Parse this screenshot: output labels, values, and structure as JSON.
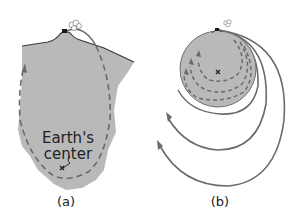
{
  "panels": [
    {
      "id": "a",
      "caption": "(a)",
      "center_label_line1": "Earth's",
      "center_label_line2": "center",
      "description": "Cross-section of Earth region with dashed trajectory from mountain-top cannon falling through toward Earth's center"
    },
    {
      "id": "b",
      "caption": "(b)",
      "description": "Small Earth with dashed internal trajectories and solid orbital arcs of increasing size launched from mountain-top cannon"
    }
  ],
  "colors": {
    "earth_fill": "#b9b9b9",
    "earth_outline": "#6e6e6e",
    "trajectory": "#6a6a6a",
    "surface_line": "#3a3a3a",
    "cannon": "#1a1a1a",
    "text": "#222222"
  },
  "icons": [
    "cannon-icon",
    "smoke-puff-icon",
    "center-marker-icon",
    "arrow-icon"
  ]
}
